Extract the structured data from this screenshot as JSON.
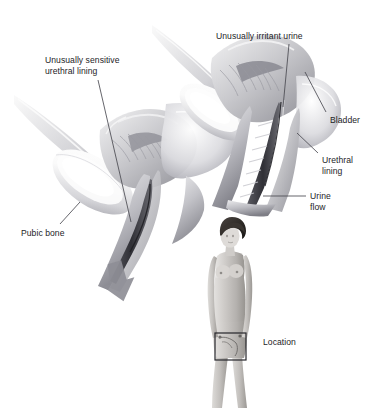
{
  "figure": {
    "type": "medical-illustration",
    "background_color": "#ffffff",
    "text_color": "#1d1d1f",
    "leader_line_color": "#4a4a52"
  },
  "labels": [
    {
      "id": "sensitive-lining",
      "lines": [
        "Unusually sensitive",
        "urethral lining"
      ],
      "x": 45,
      "y": 55,
      "align": "left"
    },
    {
      "id": "pubic-bone",
      "lines": [
        "Pubic bone"
      ],
      "x": 21,
      "y": 228,
      "align": "left"
    },
    {
      "id": "irritant-urine",
      "lines": [
        "Unusually irritant urine"
      ],
      "x": 216,
      "y": 31,
      "align": "left"
    },
    {
      "id": "bladder",
      "lines": [
        "Bladder"
      ],
      "x": 330,
      "y": 115,
      "align": "left"
    },
    {
      "id": "urethral-lining",
      "lines": [
        "Urethral",
        "lining"
      ],
      "x": 322,
      "y": 155,
      "align": "left"
    },
    {
      "id": "urine-flow",
      "lines": [
        "Urine",
        "flow"
      ],
      "x": 310,
      "y": 191,
      "align": "left"
    },
    {
      "id": "location",
      "lines": [
        "Location"
      ],
      "x": 263,
      "y": 337,
      "align": "left"
    }
  ],
  "leader_lines": [
    {
      "id": "leader-sensitive-lining",
      "x1": 98,
      "y1": 80,
      "x2": 131,
      "y2": 222
    },
    {
      "id": "leader-pubic-bone",
      "x1": 60,
      "y1": 224,
      "x2": 80,
      "y2": 202
    },
    {
      "id": "leader-irritant-urine",
      "x1": 289,
      "y1": 44,
      "x2": 283,
      "y2": 107
    },
    {
      "id": "leader-bladder",
      "x1": 326,
      "y1": 112,
      "x2": 305,
      "y2": 72
    },
    {
      "id": "leader-urethral-lining",
      "x1": 318,
      "y1": 153,
      "x2": 297,
      "y2": 133
    },
    {
      "id": "leader-urine-flow",
      "x1": 306,
      "y1": 196,
      "x2": 263,
      "y2": 196
    }
  ],
  "diagrams": {
    "left": {
      "id": "normal-view",
      "caption_labels": [
        "Unusually sensitive urethral lining",
        "Pubic bone"
      ]
    },
    "right": {
      "id": "magnified-view",
      "caption_labels": [
        "Unusually irritant urine",
        "Bladder",
        "Urethral lining",
        "Urine flow"
      ]
    },
    "body_figure": {
      "id": "location-figure",
      "sex": "female",
      "marker": "rectangle",
      "marker_rect": {
        "x": 215,
        "y": 333,
        "w": 31,
        "h": 27
      }
    }
  }
}
